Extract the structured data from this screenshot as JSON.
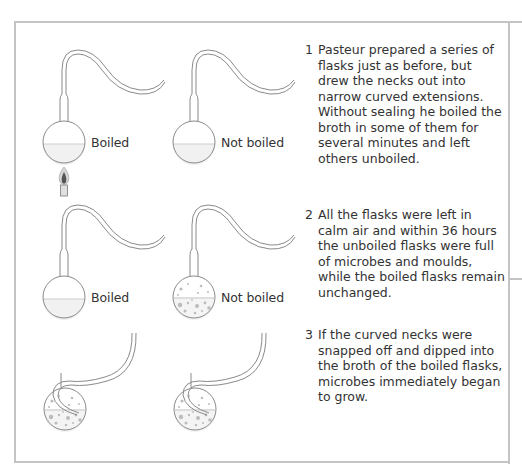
{
  "diagram": {
    "colors": {
      "frame": "#c4c4c4",
      "glass": "#8a8a8a",
      "liquid": "#f0f0f0",
      "microbes": "#b5b5b5",
      "flame": "#555555",
      "text": "#333333"
    },
    "rows": [
      {
        "flasks": [
          {
            "label": "Boiled",
            "contents": "clear broth",
            "heated": true
          },
          {
            "label": "Not boiled",
            "contents": "clear broth",
            "heated": false
          }
        ],
        "step": {
          "number": "1",
          "text": "Pasteur prepared a series of flasks just as before, but drew the necks out into narrow curved extensions. Without sealing he boiled the broth in some of them for several minutes and left others unboiled."
        }
      },
      {
        "flasks": [
          {
            "label": "Boiled",
            "contents": "clear broth"
          },
          {
            "label": "Not boiled",
            "contents": "broth with microbes"
          }
        ],
        "step": {
          "number": "2",
          "text": "All the flasks were left in calm air and within 36 hours the unboiled flasks were full of microbes and moulds, while the boiled flasks remain unchanged."
        }
      },
      {
        "flasks": [
          {
            "label": "",
            "contents": "broth with microbes, neck snapped and dipped"
          },
          {
            "label": "",
            "contents": "broth with microbes, neck snapped and dipped"
          }
        ],
        "step": {
          "number": "3",
          "text": "If the curved necks were snapped off and dipped into the broth of the boiled flasks, microbes immediately began to grow."
        }
      }
    ],
    "icons": {
      "burner": "bunsen-burner-icon",
      "flask": "swan-neck-flask-icon"
    }
  }
}
